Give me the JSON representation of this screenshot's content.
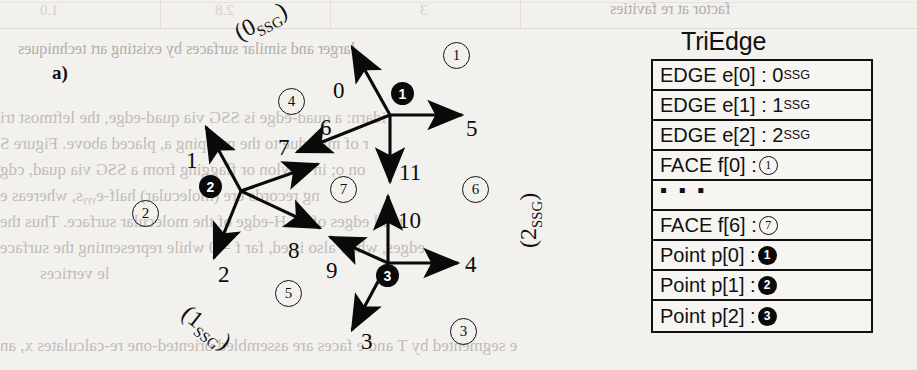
{
  "figure": {
    "panel_letter": "a)",
    "edge_labels": [
      "0",
      "1",
      "2",
      "3",
      "4",
      "5",
      "6",
      "7",
      "8",
      "9",
      "10",
      "11"
    ],
    "face_labels": [
      "1",
      "2",
      "3",
      "4",
      "5",
      "6",
      "7"
    ],
    "point_labels": [
      "1",
      "2",
      "3"
    ],
    "ssg_groups": [
      {
        "id": "ssg-0",
        "text_prefix": "(0",
        "text_sub": "SSG",
        "text_suffix": ")"
      },
      {
        "id": "ssg-1",
        "text_prefix": "(1",
        "text_sub": "SSG",
        "text_suffix": ")"
      },
      {
        "id": "ssg-2",
        "text_prefix": "(2",
        "text_sub": "SSG",
        "text_suffix": ")"
      }
    ]
  },
  "triedge": {
    "title": "TriEdge",
    "rows": [
      {
        "kind": "edge",
        "label": "EDGE e[0] : 0",
        "sub": "SSG"
      },
      {
        "kind": "edge",
        "label": "EDGE e[1] : 1",
        "sub": "SSG"
      },
      {
        "kind": "edge",
        "label": "EDGE e[2] : 2",
        "sub": "SSG"
      },
      {
        "kind": "face",
        "label": "FACE f[0] : ",
        "marker": "1"
      },
      {
        "kind": "ellipsis",
        "label": "▪ ▪ ▪"
      },
      {
        "kind": "face",
        "label": "FACE f[6] : ",
        "marker": "7"
      },
      {
        "kind": "point",
        "label": "Point p[0] : ",
        "marker": "1"
      },
      {
        "kind": "point",
        "label": "Point p[1] : ",
        "marker": "2"
      },
      {
        "kind": "point",
        "label": "Point p[2] : ",
        "marker": "3"
      }
    ]
  },
  "background_bleed": {
    "line_top_right": "factor at re favities",
    "line_title": "larger and similar surfaces by existing art techniques",
    "lines": [
      "idarn: a quad-edge is SSG via quad-edge, the leftmost tri",
      "r of mne due to the mapping a, placed above. Figure S",
      "on o; in c–wlon or flagging from a SSG via quad, cdg",
      "ng records ere (molecular) half-eᵧᵧᵧs, whereas e",
      "n all edges of : n.H-edge of the molecular surface. Thus the",
      "edges, while also is ed, far f = 0 while representing the surface",
      "le vertices",
      "e segmented by T and e faces are assembled oriented-one re-calculates x, an"
    ],
    "table_vals": [
      "1.0",
      "2.8",
      "3"
    ]
  }
}
